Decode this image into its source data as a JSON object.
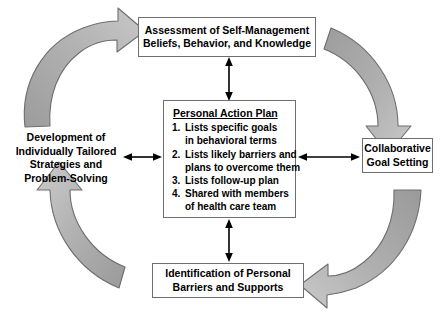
{
  "diagram": {
    "colors": {
      "arrow_gray_fill": "#a8a8a8",
      "arrow_gray_stroke": "#6e6e6e",
      "box_border": "#6e6e6e",
      "connector_black": "#000000",
      "background": "#ffffff",
      "text": "#000000"
    },
    "nodes": {
      "assessment": {
        "lines": [
          "Assessment of Self-Management",
          "Beliefs, Behavior, and Knowledge"
        ]
      },
      "action_plan": {
        "title": "Personal Action Plan",
        "items": [
          {
            "num": "1.",
            "lines": [
              "Lists specific goals",
              "in behavioral terms"
            ]
          },
          {
            "num": "2.",
            "lines": [
              "Lists likely barriers and",
              "plans to overcome them"
            ]
          },
          {
            "num": "3.",
            "lines": [
              "Lists follow-up plan"
            ]
          },
          {
            "num": "4.",
            "lines": [
              "Shared with members",
              "of health care team"
            ]
          }
        ]
      },
      "collaborative": {
        "lines": [
          "Collaborative",
          "Goal Setting"
        ]
      },
      "identification": {
        "lines": [
          "Identification of Personal",
          "Barriers and Supports"
        ]
      },
      "development": {
        "lines": [
          "Development of",
          "Individually Tailored",
          "Strategies and",
          "Problem-Solving"
        ]
      }
    },
    "connectors": [
      {
        "name": "assessment-to-plan",
        "orientation": "vertical",
        "double_headed": true
      },
      {
        "name": "development-to-plan",
        "orientation": "horizontal",
        "double_headed": true
      },
      {
        "name": "plan-to-collaborative",
        "orientation": "horizontal",
        "double_headed": true
      },
      {
        "name": "plan-to-identification",
        "orientation": "vertical",
        "double_headed": true
      }
    ],
    "cycle_arrows": [
      {
        "name": "arrow-top-left",
        "direction": "clockwise-to-top"
      },
      {
        "name": "arrow-top-right",
        "direction": "clockwise-to-right"
      },
      {
        "name": "arrow-bottom-right",
        "direction": "clockwise-to-bottom"
      },
      {
        "name": "arrow-bottom-left",
        "direction": "clockwise-to-left"
      }
    ]
  }
}
